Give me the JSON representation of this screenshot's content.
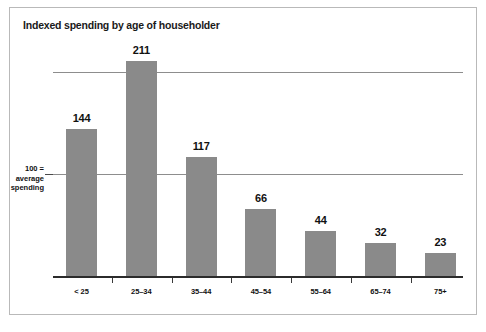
{
  "chart_data": {
    "type": "bar",
    "title": "Indexed spending by age of householder",
    "xlabel": "",
    "ylabel": "",
    "categories": [
      "< 25",
      "25–34",
      "35–44",
      "45–54",
      "55–64",
      "65–74",
      "75+"
    ],
    "values": [
      144,
      211,
      117,
      66,
      44,
      32,
      23
    ],
    "value_labels": [
      "144",
      "211",
      "117",
      "66",
      "44",
      "32",
      "23"
    ],
    "ylim": [
      0,
      220
    ],
    "gridlines": [
      100,
      200
    ],
    "grid": true,
    "legend": "none",
    "bar_color": "#8a8a8a",
    "axis_color": "#2b2b2b",
    "gridline_color": "#8d8d8d",
    "frame_color": "#b9b9b9",
    "text_color": "#111111",
    "background": "#ffffff",
    "annotation": {
      "line1": "100 =",
      "line2": "average",
      "line3": "spending",
      "at_value": 100
    }
  }
}
